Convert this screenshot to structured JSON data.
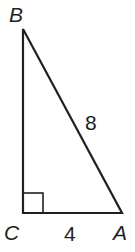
{
  "diagram": {
    "type": "right-triangle",
    "vertices": {
      "B": {
        "label": "B",
        "x": 23,
        "y": 29
      },
      "C": {
        "label": "C",
        "x": 23,
        "y": 213
      },
      "A": {
        "label": "A",
        "x": 122,
        "y": 213
      }
    },
    "right_angle_at": "C",
    "sides": {
      "AB": {
        "label": "8"
      },
      "CA": {
        "label": "4"
      }
    },
    "colors": {
      "stroke": "#231f20",
      "background": "#ffffff"
    }
  }
}
